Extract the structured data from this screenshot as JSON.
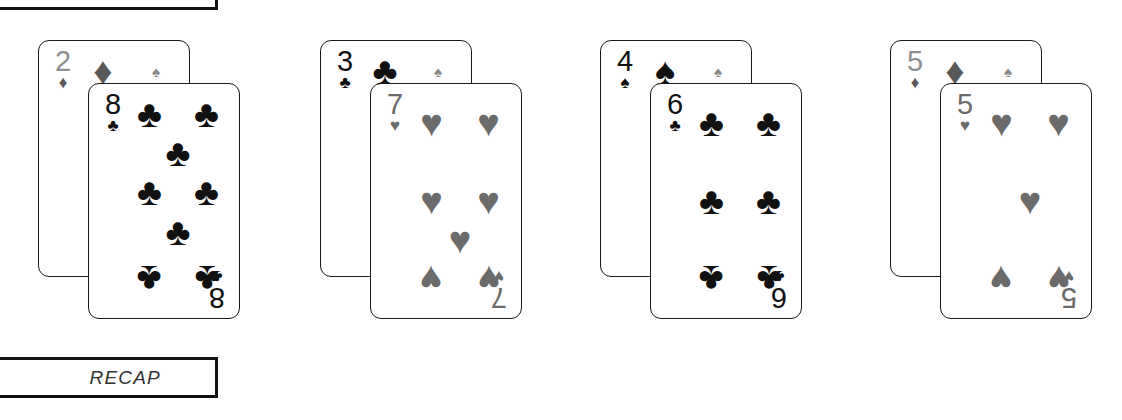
{
  "top_box": {
    "label": ""
  },
  "recap": {
    "label": "RECAP"
  },
  "colors": {
    "black": "#111111",
    "gray": "#6b6b6b",
    "light_gray": "#8f8f8f",
    "mid_gray": "#595959",
    "card_face": "#ffffff",
    "card_border": "#1a1a1a"
  },
  "pairs": [
    {
      "marker": "♠",
      "back": {
        "rank": "2",
        "suit": "♦",
        "suit_name": "diamond",
        "rank_color": "light_gray",
        "suit_color": "mid_gray"
      },
      "front": {
        "rank": "8",
        "suit": "♣",
        "suit_name": "club",
        "rank_color": "black",
        "suit_color": "black",
        "pip_count": 8
      }
    },
    {
      "marker": "♠",
      "back": {
        "rank": "3",
        "suit": "♣",
        "suit_name": "club",
        "rank_color": "black",
        "suit_color": "black"
      },
      "front": {
        "rank": "7",
        "suit": "♥",
        "suit_name": "heart",
        "rank_color": "gray",
        "suit_color": "gray",
        "pip_count": 7
      }
    },
    {
      "marker": "♠",
      "back": {
        "rank": "4",
        "suit": "♠",
        "suit_name": "spade",
        "rank_color": "black",
        "suit_color": "black"
      },
      "front": {
        "rank": "6",
        "suit": "♣",
        "suit_name": "club",
        "rank_color": "black",
        "suit_color": "black",
        "pip_count": 6
      }
    },
    {
      "marker": "♠",
      "back": {
        "rank": "5",
        "suit": "♦",
        "suit_name": "diamond",
        "rank_color": "light_gray",
        "suit_color": "mid_gray"
      },
      "front": {
        "rank": "5",
        "suit": "♥",
        "suit_name": "heart",
        "rank_color": "gray",
        "suit_color": "gray",
        "pip_count": 5
      }
    }
  ]
}
